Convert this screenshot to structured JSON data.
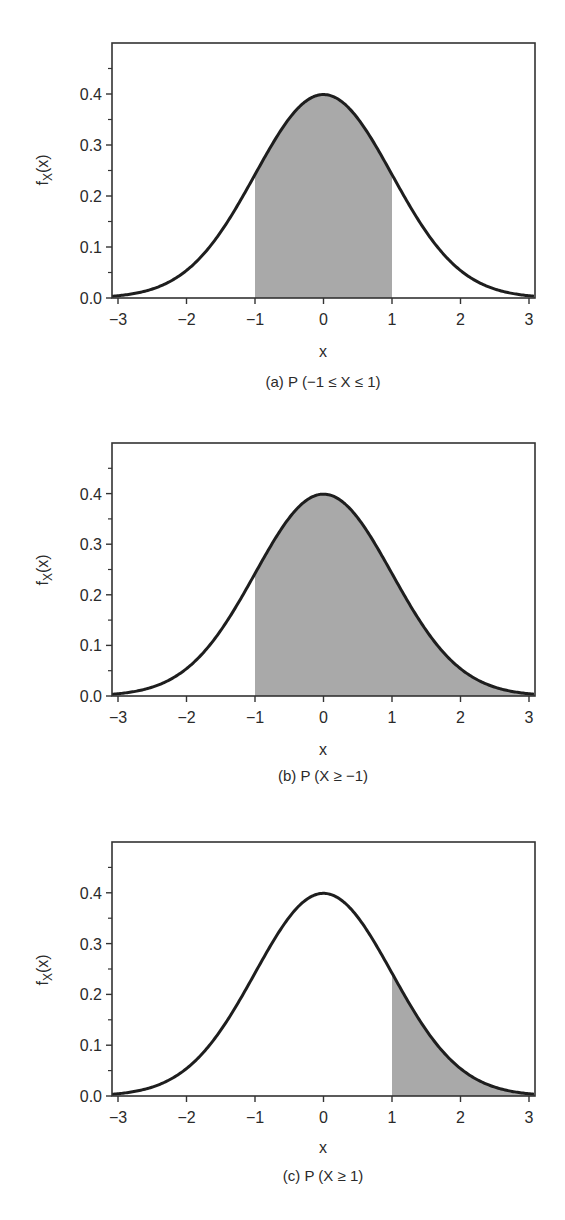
{
  "chart_data": [
    {
      "type": "area",
      "title": "(a) P (−1 ≤ X ≤ 1)",
      "xlabel": "x",
      "ylabel": "fX(x)",
      "xlim": [
        -3.1,
        3.1
      ],
      "ylim": [
        0.0,
        0.5
      ],
      "x_ticks": [
        "−3",
        "−2",
        "−1",
        "0",
        "1",
        "2",
        "3"
      ],
      "x_tick_values": [
        -3,
        -2,
        -1,
        0,
        1,
        2,
        3
      ],
      "y_ticks": [
        "0.0",
        "0.1",
        "0.2",
        "0.3",
        "0.4"
      ],
      "y_tick_values": [
        0.0,
        0.1,
        0.2,
        0.3,
        0.4
      ],
      "y_minor_ticks": [
        0.05,
        0.15,
        0.25,
        0.35,
        0.45
      ],
      "grid": false,
      "curve": "standard normal pdf",
      "series": [
        {
          "name": "f_X(x)",
          "x": [
            -3,
            -2.5,
            -2,
            -1.5,
            -1,
            -0.5,
            0,
            0.5,
            1,
            1.5,
            2,
            2.5,
            3
          ],
          "values": [
            0.0044,
            0.0175,
            0.054,
            0.1295,
            0.242,
            0.3521,
            0.3989,
            0.3521,
            0.242,
            0.1295,
            0.054,
            0.0175,
            0.0044
          ]
        }
      ],
      "shaded_region": {
        "from": -1,
        "to": 1,
        "color": "#a9a9a9"
      }
    },
    {
      "type": "area",
      "title": "(b) P (X ≥ −1)",
      "xlabel": "x",
      "ylabel": "fX(x)",
      "xlim": [
        -3.1,
        3.1
      ],
      "ylim": [
        0.0,
        0.5
      ],
      "x_ticks": [
        "−3",
        "−2",
        "−1",
        "0",
        "1",
        "2",
        "3"
      ],
      "x_tick_values": [
        -3,
        -2,
        -1,
        0,
        1,
        2,
        3
      ],
      "y_ticks": [
        "0.0",
        "0.1",
        "0.2",
        "0.3",
        "0.4"
      ],
      "y_tick_values": [
        0.0,
        0.1,
        0.2,
        0.3,
        0.4
      ],
      "y_minor_ticks": [
        0.05,
        0.15,
        0.25,
        0.35,
        0.45
      ],
      "grid": false,
      "curve": "standard normal pdf",
      "series": [
        {
          "name": "f_X(x)",
          "x": [
            -3,
            -2.5,
            -2,
            -1.5,
            -1,
            -0.5,
            0,
            0.5,
            1,
            1.5,
            2,
            2.5,
            3
          ],
          "values": [
            0.0044,
            0.0175,
            0.054,
            0.1295,
            0.242,
            0.3521,
            0.3989,
            0.3521,
            0.242,
            0.1295,
            0.054,
            0.0175,
            0.0044
          ]
        }
      ],
      "shaded_region": {
        "from": -1,
        "to": 3.1,
        "color": "#a9a9a9"
      }
    },
    {
      "type": "area",
      "title": "(c) P (X ≥ 1)",
      "xlabel": "x",
      "ylabel": "fX(x)",
      "xlim": [
        -3.1,
        3.1
      ],
      "ylim": [
        0.0,
        0.5
      ],
      "x_ticks": [
        "−3",
        "−2",
        "−1",
        "0",
        "1",
        "2",
        "3"
      ],
      "x_tick_values": [
        -3,
        -2,
        -1,
        0,
        1,
        2,
        3
      ],
      "y_ticks": [
        "0.0",
        "0.1",
        "0.2",
        "0.3",
        "0.4"
      ],
      "y_tick_values": [
        0.0,
        0.1,
        0.2,
        0.3,
        0.4
      ],
      "y_minor_ticks": [
        0.05,
        0.15,
        0.25,
        0.35,
        0.45
      ],
      "grid": false,
      "curve": "standard normal pdf",
      "series": [
        {
          "name": "f_X(x)",
          "x": [
            -3,
            -2.5,
            -2,
            -1.5,
            -1,
            -0.5,
            0,
            0.5,
            1,
            1.5,
            2,
            2.5,
            3
          ],
          "values": [
            0.0044,
            0.0175,
            0.054,
            0.1295,
            0.242,
            0.3521,
            0.3989,
            0.3521,
            0.242,
            0.1295,
            0.054,
            0.0175,
            0.0044
          ]
        }
      ],
      "shaded_region": {
        "from": 1,
        "to": 3.1,
        "color": "#a9a9a9"
      }
    }
  ],
  "panels": [
    {
      "caption": "(a) P (−1 ≤ X ≤ 1)",
      "xlabel": "x",
      "ylabel_main": "f",
      "ylabel_sub": "X",
      "ylabel_tail": "(x)"
    },
    {
      "caption": "(b) P (X ≥ −1)",
      "xlabel": "x",
      "ylabel_main": "f",
      "ylabel_sub": "X",
      "ylabel_tail": "(x)"
    },
    {
      "caption": "(c) P (X ≥ 1)",
      "xlabel": "x",
      "ylabel_main": "f",
      "ylabel_sub": "X",
      "ylabel_tail": "(x)"
    }
  ],
  "colors": {
    "curve": "#1e1e1e",
    "axis": "#333333",
    "shade": "#a9a9a9"
  }
}
